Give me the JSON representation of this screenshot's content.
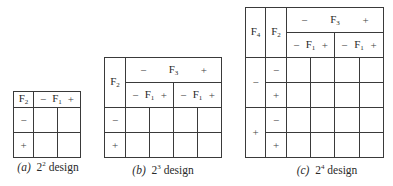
{
  "designs": {
    "a": {
      "caption_label": "(a)",
      "caption_base": "2",
      "caption_exp": "2",
      "caption_word": "design",
      "row_factor": "F",
      "row_factor_sub": "2",
      "col_factor": "F",
      "col_factor_sub": "1",
      "minus": "−",
      "plus": "+",
      "row_levels": [
        "−",
        "+"
      ]
    },
    "b": {
      "caption_label": "(b)",
      "caption_base": "2",
      "caption_exp": "3",
      "caption_word": "design",
      "row_factor": "F",
      "row_factor_sub": "2",
      "outer_col_factor": "F",
      "outer_col_factor_sub": "3",
      "inner_col_factor": "F",
      "inner_col_factor_sub": "1",
      "minus": "−",
      "plus": "+",
      "row_levels": [
        "−",
        "+"
      ]
    },
    "c": {
      "caption_label": "(c)",
      "caption_base": "2",
      "caption_exp": "4",
      "caption_word": "design",
      "outer_row_factor": "F",
      "outer_row_factor_sub": "4",
      "inner_row_factor": "F",
      "inner_row_factor_sub": "2",
      "outer_col_factor": "F",
      "outer_col_factor_sub": "3",
      "inner_col_factor": "F",
      "inner_col_factor_sub": "1",
      "minus": "−",
      "plus": "+",
      "outer_row_levels": [
        "−",
        "+"
      ],
      "inner_row_levels": [
        "−",
        "+",
        "−",
        "+"
      ]
    }
  }
}
